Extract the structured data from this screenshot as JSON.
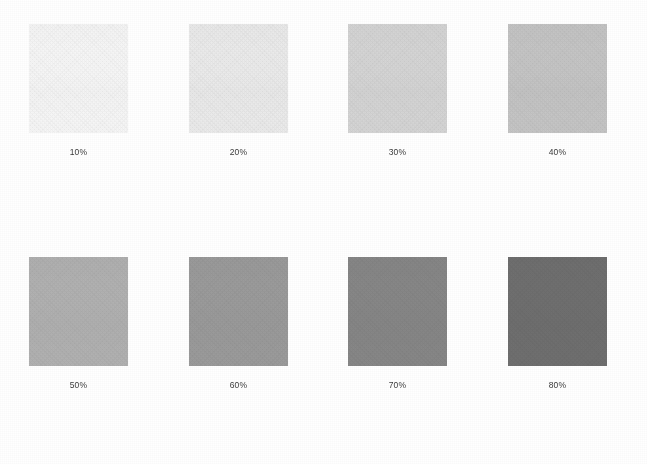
{
  "chart_data": {
    "type": "bar",
    "xlabel": "",
    "ylabel": "",
    "categories": [
      "10%",
      "20%",
      "30%",
      "40%",
      "50%",
      "60%",
      "70%",
      "80%"
    ],
    "values": [
      10,
      20,
      30,
      40,
      50,
      60,
      70,
      80
    ],
    "series": [
      {
        "name": "Tint density",
        "values": [
          10,
          20,
          30,
          40,
          50,
          60,
          70,
          80
        ]
      }
    ],
    "colors": [
      "#f6f6f6",
      "#ebebeb",
      "#d5d5d5",
      "#c5c5c5",
      "#b1b1b1",
      "#9b9b9b",
      "#878787",
      "#6f6f6f"
    ],
    "grid": false,
    "legend": "none",
    "background": "#ffffff"
  },
  "chart": {
    "background": "#ffffff",
    "label_color": "#3b3b3b",
    "rows": 2,
    "columns": 4
  },
  "swatches": [
    {
      "label": "10%",
      "percent": 10,
      "color": "#f6f6f6",
      "x": 29,
      "y": 24
    },
    {
      "label": "20%",
      "percent": 20,
      "color": "#ebebeb",
      "x": 189,
      "y": 24
    },
    {
      "label": "30%",
      "percent": 30,
      "color": "#d5d5d5",
      "x": 348,
      "y": 24
    },
    {
      "label": "40%",
      "percent": 40,
      "color": "#c5c5c5",
      "x": 508,
      "y": 24
    },
    {
      "label": "50%",
      "percent": 50,
      "color": "#b1b1b1",
      "x": 29,
      "y": 257
    },
    {
      "label": "60%",
      "percent": 60,
      "color": "#9b9b9b",
      "x": 189,
      "y": 257
    },
    {
      "label": "70%",
      "percent": 70,
      "color": "#878787",
      "x": 348,
      "y": 257
    },
    {
      "label": "80%",
      "percent": 80,
      "color": "#6f6f6f",
      "x": 508,
      "y": 257
    }
  ]
}
